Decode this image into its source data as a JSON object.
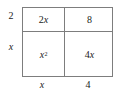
{
  "diagram": {
    "kind": "area-model-box",
    "border_color": "#7d7d7d",
    "text_color": "#1a1a1a",
    "background_color": "#ffffff"
  },
  "edge_labels": {
    "left_top": "2",
    "left_bottom": "x",
    "bottom_left": "x",
    "bottom_right": "4"
  },
  "cells": {
    "top_left": {
      "coefficient": "2",
      "variable": "x",
      "exponent": "",
      "text": "2x"
    },
    "top_right": {
      "coefficient": "8",
      "variable": "",
      "exponent": "",
      "text": "8"
    },
    "bottom_left": {
      "coefficient": "",
      "variable": "x",
      "exponent": "2",
      "text": "x2"
    },
    "bottom_right": {
      "coefficient": "4",
      "variable": "x",
      "exponent": "",
      "text": "4x"
    }
  }
}
